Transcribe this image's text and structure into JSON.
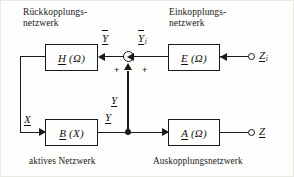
{
  "figure": {
    "type": "block-diagram",
    "background_color": "#fdfdfb",
    "line_color": "#1a1a1a"
  },
  "headings": {
    "feedback_network": "Rückkopplungs-\nnetzwerk",
    "input_network": "Einkopplungs-\nnetzwerk"
  },
  "captions": {
    "active_network": "aktives Netzwerk",
    "output_network": "Auskopplungsnetzwerk"
  },
  "blocks": {
    "h": {
      "name": "H",
      "arg": "(Ω)",
      "label": "H (Ω)",
      "role": "feedback-network"
    },
    "e": {
      "name": "E",
      "arg": "(Ω)",
      "label": "E (Ω)",
      "role": "input-network"
    },
    "b": {
      "name": "B",
      "arg": "(X)",
      "label": "B (X)",
      "role": "active-network"
    },
    "a": {
      "name": "A",
      "arg": "(Ω)",
      "label": "A (Ω)",
      "role": "output-network"
    }
  },
  "signals": {
    "y_bar": {
      "base": "Y",
      "overbar": true,
      "underline": true,
      "subscript": ""
    },
    "y_i": {
      "base": "Y",
      "overbar": true,
      "underline": true,
      "subscript": "i"
    },
    "z_i": {
      "base": "Z",
      "overbar": false,
      "underline": true,
      "subscript": "i"
    },
    "y_upper": {
      "base": "Y",
      "overbar": false,
      "underline": true,
      "subscript": ""
    },
    "y_lower": {
      "base": "Y",
      "overbar": false,
      "underline": true,
      "subscript": ""
    },
    "x": {
      "base": "X",
      "overbar": false,
      "underline": true,
      "subscript": ""
    },
    "z": {
      "base": "Z",
      "overbar": false,
      "underline": true,
      "subscript": ""
    }
  },
  "summing_junction": {
    "sign_left": "+",
    "sign_right": "+",
    "sign_bottom": "+"
  },
  "terminals": {
    "input": "Z_i",
    "output": "Z"
  }
}
